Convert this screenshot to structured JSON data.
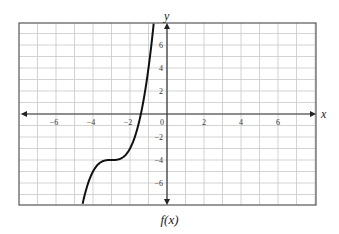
{
  "chart_data": {
    "type": "line",
    "title": "f(x)",
    "xlabel": "x",
    "ylabel": "y",
    "xlim": [
      -8,
      8
    ],
    "ylim": [
      -8,
      8
    ],
    "grid": true,
    "x_ticks": [
      -6,
      -4,
      -2,
      0,
      2,
      4,
      6
    ],
    "y_ticks": [
      6,
      4,
      2,
      -2,
      -4,
      -6
    ],
    "origin_label": "0",
    "series": [
      {
        "name": "f(x)",
        "function": "(x+3)^3 - 4",
        "inflection_point": [
          -3,
          -4
        ],
        "x_intercept": -1.41,
        "y_intercept": 23,
        "points": [
          [
            -4.5,
            -7.4
          ],
          [
            -4,
            -5
          ],
          [
            -3.5,
            -4.1
          ],
          [
            -3,
            -4
          ],
          [
            -2.5,
            -3.9
          ],
          [
            -2,
            -3
          ],
          [
            -1.5,
            -0.6
          ],
          [
            -1.41,
            0
          ],
          [
            -1,
            4
          ],
          [
            -0.8,
            6.6
          ]
        ]
      }
    ],
    "legend": null
  },
  "caption": "f(x)",
  "axes": {
    "x_name": "x",
    "y_name": "y"
  }
}
